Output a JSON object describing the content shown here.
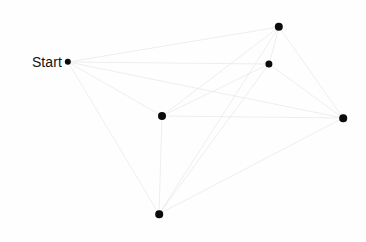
{
  "canvas": {
    "width": 366,
    "height": 242,
    "background_color": "#fefefe"
  },
  "style": {
    "edge_color": "#e6e6e6",
    "edge_width": 0.7,
    "node_color": "#0b0b0b",
    "label_color": "#111111"
  },
  "diagram": {
    "title_label": "Start",
    "nodes": [
      {
        "id": "start",
        "name": "start-node",
        "x": 68,
        "y": 62,
        "r": 3.2,
        "label": "Start",
        "label_x": 62,
        "label_y": 62
      },
      {
        "id": "top",
        "name": "top-node",
        "x": 279,
        "y": 27,
        "r": 4.2,
        "label": ""
      },
      {
        "id": "upper_right",
        "name": "upper-right-node",
        "x": 269,
        "y": 64,
        "r": 3.6,
        "label": ""
      },
      {
        "id": "right",
        "name": "right-node",
        "x": 343,
        "y": 118,
        "r": 3.8,
        "label": ""
      },
      {
        "id": "center",
        "name": "center-node",
        "x": 162,
        "y": 116,
        "r": 4.0,
        "label": ""
      },
      {
        "id": "bottom",
        "name": "bottom-node",
        "x": 159,
        "y": 214,
        "r": 3.8,
        "label": ""
      }
    ],
    "edges": [
      {
        "from": "start",
        "to": "top"
      },
      {
        "from": "start",
        "to": "upper_right"
      },
      {
        "from": "start",
        "to": "right"
      },
      {
        "from": "start",
        "to": "center"
      },
      {
        "from": "start",
        "to": "bottom"
      },
      {
        "from": "top",
        "to": "upper_right"
      },
      {
        "from": "top",
        "to": "right"
      },
      {
        "from": "top",
        "to": "center"
      },
      {
        "from": "top",
        "to": "bottom"
      },
      {
        "from": "upper_right",
        "to": "right"
      },
      {
        "from": "upper_right",
        "to": "center"
      },
      {
        "from": "upper_right",
        "to": "bottom"
      },
      {
        "from": "right",
        "to": "center"
      },
      {
        "from": "right",
        "to": "bottom"
      },
      {
        "from": "center",
        "to": "bottom"
      }
    ]
  }
}
